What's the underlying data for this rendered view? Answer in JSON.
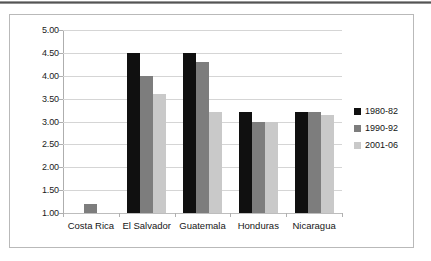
{
  "chart_data": {
    "type": "bar",
    "title": "",
    "subtitle": "",
    "xlabel": "",
    "ylabel": "",
    "ylim": [
      1.0,
      5.0
    ],
    "ytick_step": 0.5,
    "ytick_labels": [
      "5.00",
      "4.50",
      "4.00",
      "3.50",
      "3.00",
      "2.50",
      "2.00",
      "1.50",
      "1.00"
    ],
    "ytick_values": [
      5.0,
      4.5,
      4.0,
      3.5,
      3.0,
      2.5,
      2.0,
      1.5,
      1.0
    ],
    "grid": true,
    "grid_axis": "y",
    "legend_position": "right",
    "categories": [
      "Costa Rica",
      "El Salvador",
      "Guatemala",
      "Honduras",
      "Nicaragua"
    ],
    "series": [
      {
        "name": "1980-82",
        "color": "#101010",
        "values": [
          null,
          4.5,
          4.5,
          3.2,
          3.2
        ]
      },
      {
        "name": "1990-92",
        "color": "#7d7d7d",
        "values": [
          1.2,
          4.0,
          4.3,
          3.0,
          3.2
        ]
      },
      {
        "name": "2001-06",
        "color": "#c9c9c9",
        "values": [
          null,
          3.6,
          3.2,
          3.0,
          3.15
        ]
      }
    ]
  }
}
